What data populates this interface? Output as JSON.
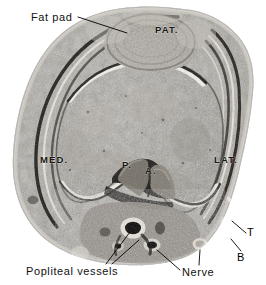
{
  "figure": {
    "kind": "anatomical-photograph",
    "palette": {
      "background": "#ffffff",
      "specimen_mid_gray": "#9a968f",
      "specimen_dark": "#2a2723",
      "cartilage_white": "#f2efe8",
      "capsule_black": "#151310",
      "label_ink": "#000000"
    }
  },
  "labels": {
    "outer": [
      {
        "id": "fat-pad",
        "text": "Fat pad"
      },
      {
        "id": "popliteal-vessels",
        "text": "Popliteal vessels"
      },
      {
        "id": "nerve",
        "text": "Nerve"
      },
      {
        "id": "tendon",
        "text": "T"
      },
      {
        "id": "biceps",
        "text": "B"
      }
    ],
    "inner": [
      {
        "id": "patella",
        "text": "PAT."
      },
      {
        "id": "medial-condyle",
        "text": "MED."
      },
      {
        "id": "lateral-condyle",
        "text": "LAT."
      },
      {
        "id": "posterior-cruciate",
        "text": "P."
      },
      {
        "id": "anterior-cruciate",
        "text": "A."
      }
    ]
  }
}
